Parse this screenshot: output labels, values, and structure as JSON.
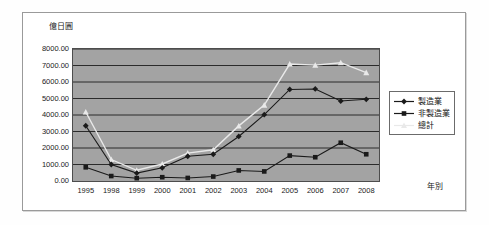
{
  "chart_data": {
    "type": "line",
    "title": "",
    "xlabel": "年別",
    "ylabel": "億日圓",
    "categories": [
      "1995",
      "1998",
      "1999",
      "2000",
      "2001",
      "2002",
      "2003",
      "2004",
      "2005",
      "2006",
      "2007",
      "2008"
    ],
    "ylim": [
      0,
      8000
    ],
    "ytick_step": 1000,
    "ytick_labels": [
      "8000.00",
      "7000.00",
      "6000.00",
      "5000.00",
      "4000.00",
      "3000.00",
      "2000.00",
      "1000.00",
      "0.00"
    ],
    "grid": "horizontal",
    "legend_position": "right",
    "plot_background": "#a3a3a3",
    "series": [
      {
        "name": "製造業",
        "marker": "diamond",
        "color": "#1a1a1a",
        "values": [
          3350,
          1000,
          480,
          800,
          1500,
          1620,
          2700,
          4020,
          5550,
          5580,
          4850,
          4950
        ]
      },
      {
        "name": "非製造業",
        "marker": "square",
        "color": "#1a1a1a",
        "values": [
          830,
          300,
          170,
          230,
          185,
          270,
          640,
          580,
          1540,
          1440,
          2320,
          1620
        ]
      },
      {
        "name": "總計",
        "marker": "triangle",
        "color": "#e9e9e9",
        "values": [
          4180,
          1300,
          650,
          1030,
          1690,
          1890,
          3340,
          4600,
          7090,
          7020,
          7170,
          6570
        ]
      }
    ]
  },
  "legend": {
    "items": [
      {
        "label": "製造業"
      },
      {
        "label": "非製造業"
      },
      {
        "label": "總計"
      }
    ]
  }
}
